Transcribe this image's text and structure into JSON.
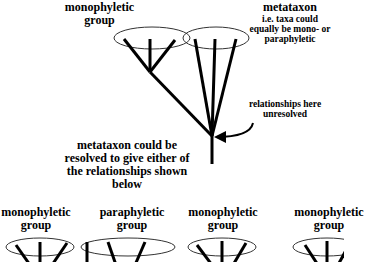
{
  "top_left_label": {
    "line1": "monophyletic",
    "line2": "group"
  },
  "metataxon_label": {
    "title": "metataxon",
    "line1": "i.e. taxa could",
    "line2": "equally be mono- or",
    "line3": "paraphyletic"
  },
  "unresolved_label": {
    "line1": "relationships here",
    "line2": "unresolved"
  },
  "resolution_note": {
    "line1": "metataxon could be",
    "line2": "resolved to give either of",
    "line3": "the relationships shown",
    "line4": "below"
  },
  "bottom_labels": [
    {
      "line1": "monophyletic",
      "line2": "group"
    },
    {
      "line1": "paraphyletic",
      "line2": "group"
    },
    {
      "line1": "monophyletic",
      "line2": "group"
    },
    {
      "line1": "monophyletic",
      "line2": "group"
    }
  ],
  "colors": {
    "line": "#000000",
    "ellipse": "#333333",
    "background": "#ffffff"
  }
}
